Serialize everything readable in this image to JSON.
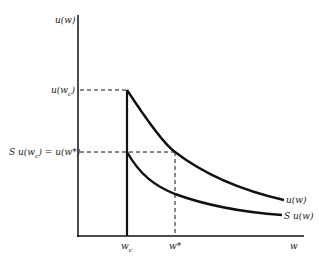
{
  "diagram": {
    "y_axis_label": "u(w)",
    "x_axis_label": "w",
    "labels": {
      "u_wc": "u(w",
      "u_wc_sub": "c",
      "u_wc_close": ")",
      "s_u_wc_eq": "S u(w",
      "s_u_wc_sub": "c",
      "s_u_wc_rest": ") = u(w*)",
      "wc": "w",
      "wc_sub": "c",
      "wstar": "w*",
      "w": "w",
      "curve_upper": "u(w)",
      "curve_lower": "S u(w)"
    },
    "colors": {
      "line": "#111111",
      "background": "#ffffff"
    }
  }
}
